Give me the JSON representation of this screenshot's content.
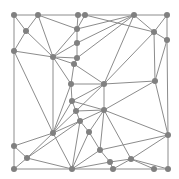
{
  "diagram": {
    "type": "triangulated-mesh",
    "colors": {
      "background": "#ffffff",
      "edge": "#8c8c8c",
      "node": "#808080",
      "border": "#7a7a7a"
    },
    "node_radius": 3,
    "bounds": [
      14,
      15,
      168,
      169
    ],
    "nodes": [
      [
        14,
        15
      ],
      [
        38,
        15
      ],
      [
        78,
        15
      ],
      [
        85,
        15
      ],
      [
        134,
        15
      ],
      [
        167,
        15
      ],
      [
        26,
        31
      ],
      [
        77,
        29
      ],
      [
        154,
        32
      ],
      [
        167,
        40
      ],
      [
        14,
        51
      ],
      [
        77,
        43
      ],
      [
        53,
        57
      ],
      [
        77,
        58
      ],
      [
        74,
        64
      ],
      [
        104,
        84
      ],
      [
        155,
        81
      ],
      [
        71,
        84
      ],
      [
        72,
        101
      ],
      [
        76,
        111
      ],
      [
        104,
        110
      ],
      [
        53,
        133
      ],
      [
        80,
        121
      ],
      [
        89,
        132
      ],
      [
        168,
        135
      ],
      [
        14,
        146
      ],
      [
        27,
        158
      ],
      [
        100,
        150
      ],
      [
        110,
        162
      ],
      [
        131,
        159
      ],
      [
        14,
        169
      ],
      [
        72,
        169
      ],
      [
        113,
        169
      ],
      [
        154,
        169
      ],
      [
        168,
        169
      ]
    ],
    "edges": [
      [
        0,
        1
      ],
      [
        1,
        2
      ],
      [
        2,
        3
      ],
      [
        3,
        4
      ],
      [
        4,
        5
      ],
      [
        0,
        10
      ],
      [
        10,
        25
      ],
      [
        25,
        30
      ],
      [
        5,
        9
      ],
      [
        9,
        24
      ],
      [
        24,
        34
      ],
      [
        30,
        31
      ],
      [
        31,
        32
      ],
      [
        32,
        33
      ],
      [
        33,
        34
      ],
      [
        0,
        6
      ],
      [
        1,
        6
      ],
      [
        6,
        10
      ],
      [
        1,
        12
      ],
      [
        6,
        12
      ],
      [
        10,
        12
      ],
      [
        1,
        7
      ],
      [
        2,
        7
      ],
      [
        3,
        7
      ],
      [
        7,
        11
      ],
      [
        11,
        13
      ],
      [
        13,
        14
      ],
      [
        14,
        17
      ],
      [
        17,
        18
      ],
      [
        18,
        19
      ],
      [
        3,
        8
      ],
      [
        4,
        8
      ],
      [
        5,
        8
      ],
      [
        8,
        9
      ],
      [
        8,
        15
      ],
      [
        9,
        16
      ],
      [
        8,
        16
      ],
      [
        15,
        16
      ],
      [
        4,
        7
      ],
      [
        4,
        11
      ],
      [
        4,
        13
      ],
      [
        4,
        15
      ],
      [
        12,
        11
      ],
      [
        12,
        13
      ],
      [
        12,
        14
      ],
      [
        12,
        17
      ],
      [
        12,
        21
      ],
      [
        10,
        21
      ],
      [
        7,
        12
      ],
      [
        14,
        15
      ],
      [
        17,
        15
      ],
      [
        18,
        15
      ],
      [
        19,
        15
      ],
      [
        20,
        15
      ],
      [
        20,
        16
      ],
      [
        16,
        24
      ],
      [
        20,
        24
      ],
      [
        18,
        20
      ],
      [
        19,
        20
      ],
      [
        19,
        22
      ],
      [
        22,
        20
      ],
      [
        22,
        23
      ],
      [
        23,
        20
      ],
      [
        23,
        27
      ],
      [
        20,
        27
      ],
      [
        27,
        24
      ],
      [
        27,
        28
      ],
      [
        28,
        29
      ],
      [
        29,
        24
      ],
      [
        29,
        33
      ],
      [
        29,
        34
      ],
      [
        20,
        29
      ],
      [
        21,
        18
      ],
      [
        21,
        19
      ],
      [
        21,
        22
      ],
      [
        21,
        25
      ],
      [
        21,
        26
      ],
      [
        25,
        26
      ],
      [
        26,
        30
      ],
      [
        26,
        31
      ],
      [
        26,
        22
      ],
      [
        22,
        31
      ],
      [
        23,
        31
      ],
      [
        27,
        31
      ],
      [
        28,
        31
      ],
      [
        28,
        32
      ],
      [
        29,
        32
      ],
      [
        21,
        31
      ],
      [
        17,
        21
      ]
    ]
  }
}
